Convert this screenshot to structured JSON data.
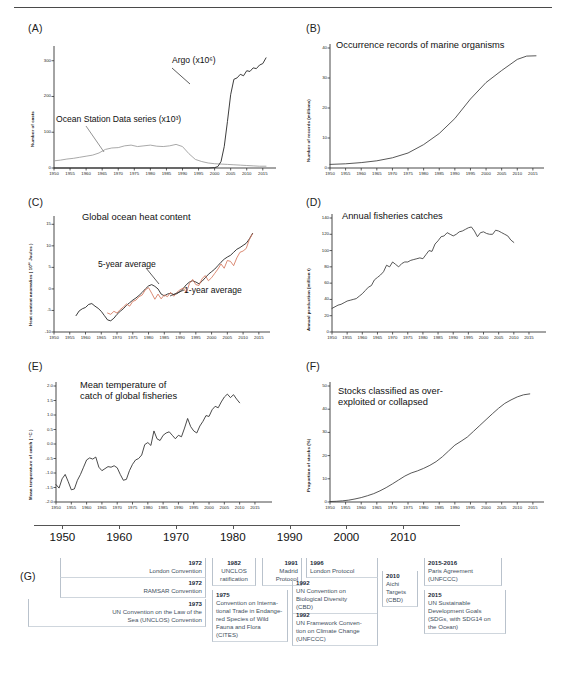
{
  "figure": {
    "panels": [
      "(A)",
      "(B)",
      "(C)",
      "(D)",
      "(E)",
      "(F)",
      "(G)"
    ]
  },
  "panelA": {
    "label": "(A)",
    "ylabel": "Number of casts",
    "annotation_ocean": "Ocean Station Data series (x10³)",
    "annotation_argo": "Argo (x10⁶)"
  },
  "panelB": {
    "label": "(B)",
    "title": "Occurrence records of marine organisms",
    "ylabel": "Number of records (millions)"
  },
  "panelC": {
    "label": "(C)",
    "title": "Global ocean heat content",
    "ylabel": "Heat content anomalies ( 10²² Joules )",
    "annotation_5yr": "5-year average",
    "annotation_1yr": "1-year average",
    "color_1yr": "#d4765c",
    "color_5yr": "#1a1a1a"
  },
  "panelD": {
    "label": "(D)",
    "title": "Annual fisheries catches",
    "ylabel": "Annual production (million t)"
  },
  "panelE": {
    "label": "(E)",
    "title": "Mean temperature of\ncatch of global fisheries",
    "ylabel": "Mean temperature of catch ( °C )"
  },
  "panelF": {
    "label": "(F)",
    "title": "Stocks classified as over-\nexploited or collapsed",
    "ylabel": "Proportion of stocks (%)"
  },
  "panelG": {
    "label": "(G)",
    "axis_years": [
      1950,
      1960,
      1970,
      1980,
      1990,
      2000,
      2010
    ],
    "events": [
      {
        "year": "1972",
        "text": "London Convention",
        "align": "right"
      },
      {
        "year": "1972",
        "text": "RAMSAR Convention",
        "align": "right"
      },
      {
        "year": "1973",
        "text": "UN Convention on the Law of the\nSea (UNCLOS) Convention",
        "align": "right"
      },
      {
        "year": "1982",
        "text": "UNCLOS\nratification",
        "align": "center"
      },
      {
        "year": "1975",
        "text": "Convention on Interna-\ntional Trade in Endange-\nred Species of Wild\nFauna and Flora (CITES)",
        "align": "left"
      },
      {
        "year": "1991",
        "text": "Madrid\nProtocol",
        "align": "right"
      },
      {
        "year": "1996",
        "text": "London Protocol",
        "align": "left"
      },
      {
        "year": "1992",
        "text": "UN Convention on\nBiological Diversity\n(CBD)",
        "align": "left"
      },
      {
        "year": "1992",
        "text": "UN Framework Conven-\ntion on Climate Change\n(UNFCCC)",
        "align": "left"
      },
      {
        "year": "2010",
        "text": "Aichi\nTargets\n(CBD)",
        "align": "left"
      },
      {
        "year": "2015-2016",
        "text": "Paris Agreement\n(UNFCCC)",
        "align": "left"
      },
      {
        "year": "2015",
        "text": "UN Sustainable\nDevelopment Goals\n(SDGs, with SDG14 on\nthe Ocean)",
        "align": "left"
      }
    ]
  },
  "chart_data": [
    {
      "id": "A",
      "type": "line",
      "title": "",
      "xlabel": "",
      "ylabel": "Number of casts",
      "xlim": [
        1950,
        2016
      ],
      "ylim": [
        0,
        330
      ],
      "yticks": [
        0,
        100,
        200,
        300
      ],
      "xticks": [
        1950,
        1955,
        1960,
        1965,
        1970,
        1975,
        1980,
        1985,
        1990,
        1995,
        2000,
        2005,
        2010,
        2015
      ],
      "grid": false,
      "legend": "inline-annotations",
      "series": [
        {
          "name": "Ocean Station Data series (x10^3)",
          "color": "#9a9a9a",
          "x": [
            1950,
            1952,
            1954,
            1956,
            1958,
            1960,
            1962,
            1964,
            1966,
            1968,
            1970,
            1972,
            1974,
            1976,
            1978,
            1980,
            1982,
            1984,
            1986,
            1988,
            1990,
            1992,
            1994,
            1996,
            1998,
            2000,
            2002,
            2004,
            2006,
            2008,
            2010,
            2012,
            2014,
            2016
          ],
          "y": [
            20,
            22,
            25,
            27,
            30,
            33,
            36,
            42,
            52,
            56,
            57,
            62,
            64,
            60,
            62,
            64,
            61,
            60,
            62,
            66,
            60,
            40,
            24,
            18,
            14,
            12,
            11,
            10,
            9,
            8,
            7,
            6,
            5,
            5
          ]
        },
        {
          "name": "Argo (x10^6)",
          "color": "#1a1a1a",
          "x": [
            1950,
            1990,
            1998,
            2000,
            2001,
            2002,
            2003,
            2004,
            2005,
            2006,
            2007,
            2008,
            2009,
            2010,
            2011,
            2012,
            2013,
            2014,
            2015,
            2016
          ],
          "y": [
            0,
            0,
            0,
            1,
            4,
            18,
            60,
            130,
            205,
            248,
            252,
            262,
            258,
            272,
            270,
            280,
            278,
            288,
            292,
            308
          ]
        }
      ]
    },
    {
      "id": "B",
      "type": "line",
      "title": "Occurrence records of marine organisms",
      "ylabel": "Number of records (millions)",
      "xlim": [
        1950,
        2016
      ],
      "ylim": [
        0,
        40
      ],
      "yticks": [
        0,
        10,
        20,
        30,
        40
      ],
      "xticks": [
        1950,
        1955,
        1960,
        1965,
        1970,
        1975,
        1980,
        1985,
        1990,
        1995,
        2000,
        2005,
        2010,
        2015
      ],
      "grid": false,
      "series": [
        {
          "name": "Cumulative occurrence records",
          "color": "#3a3a3a",
          "x": [
            1950,
            1955,
            1960,
            1965,
            1970,
            1975,
            1980,
            1985,
            1990,
            1995,
            2000,
            2005,
            2010,
            2013,
            2016
          ],
          "y": [
            1.2,
            1.4,
            1.8,
            2.4,
            3.4,
            5.0,
            7.8,
            11.5,
            16.5,
            23.0,
            28.5,
            32.5,
            36.2,
            37.3,
            37.4
          ]
        }
      ]
    },
    {
      "id": "C",
      "type": "line",
      "title": "Global ocean heat content",
      "ylabel": "Heat content anomalies (10^22 Joules)",
      "xlim": [
        1950,
        2016
      ],
      "ylim": [
        -10,
        16
      ],
      "yticks": [
        -10,
        -5,
        0,
        5,
        10,
        15
      ],
      "xticks": [
        1950,
        1955,
        1960,
        1965,
        1970,
        1975,
        1980,
        1985,
        1990,
        1995,
        2000,
        2005,
        2010,
        2015
      ],
      "grid": false,
      "series": [
        {
          "name": "5-year average",
          "color": "#1a1a1a",
          "x": [
            1957,
            1958,
            1959,
            1960,
            1961,
            1962,
            1963,
            1964,
            1965,
            1966,
            1967,
            1968,
            1969,
            1970,
            1971,
            1972,
            1973,
            1974,
            1975,
            1976,
            1977,
            1978,
            1979,
            1980,
            1981,
            1982,
            1983,
            1984,
            1985,
            1986,
            1987,
            1988,
            1989,
            1990,
            1991,
            1992,
            1993,
            1994,
            1995,
            1996,
            1997,
            1998,
            1999,
            2000,
            2001,
            2002,
            2003,
            2004,
            2005,
            2006,
            2007,
            2008,
            2009,
            2010,
            2011,
            2012,
            2013
          ],
          "y": [
            -6.2,
            -5.1,
            -4.6,
            -4.3,
            -3.6,
            -3.4,
            -4.0,
            -4.5,
            -5.2,
            -6.2,
            -7.2,
            -7.4,
            -6.8,
            -5.9,
            -5.2,
            -4.6,
            -3.8,
            -3.2,
            -2.6,
            -2.1,
            -1.5,
            -0.8,
            0.0,
            0.7,
            1.0,
            0.6,
            0.0,
            -1.2,
            -1.6,
            -1.2,
            -1.0,
            -1.3,
            -1.1,
            -0.6,
            0.1,
            1.0,
            1.6,
            1.9,
            1.6,
            1.2,
            1.8,
            2.6,
            3.4,
            4.0,
            4.6,
            5.4,
            6.2,
            6.9,
            7.4,
            7.8,
            8.5,
            9.2,
            9.6,
            10.1,
            10.6,
            11.6,
            12.9
          ]
        },
        {
          "name": "1-year average",
          "color": "#d4765c",
          "x": [
            1967,
            1968,
            1969,
            1970,
            1971,
            1972,
            1973,
            1974,
            1975,
            1976,
            1977,
            1978,
            1979,
            1980,
            1981,
            1982,
            1983,
            1984,
            1985,
            1986,
            1987,
            1988,
            1989,
            1990,
            1991,
            1992,
            1993,
            1994,
            1995,
            1996,
            1997,
            1998,
            1999,
            2000,
            2001,
            2002,
            2003,
            2004,
            2005,
            2006,
            2007,
            2008,
            2009,
            2010,
            2011,
            2012,
            2013
          ],
          "y": [
            -5.6,
            -5.9,
            -5.2,
            -5.6,
            -4.8,
            -4.2,
            -3.5,
            -4.0,
            -2.9,
            -2.6,
            -1.8,
            -1.4,
            -0.2,
            0.3,
            -1.0,
            -2.4,
            -1.2,
            -2.3,
            -1.4,
            -1.8,
            -0.8,
            -1.7,
            -0.8,
            -0.2,
            0.2,
            -0.9,
            1.3,
            2.2,
            1.0,
            0.8,
            2.4,
            3.1,
            1.9,
            2.6,
            3.6,
            4.6,
            5.8,
            4.8,
            6.6,
            6.4,
            5.4,
            7.2,
            8.5,
            8.8,
            9.4,
            11.5,
            12.8
          ]
        }
      ]
    },
    {
      "id": "D",
      "type": "line",
      "title": "Annual fisheries catches",
      "ylabel": "Annual production (million t)",
      "xlim": [
        1950,
        2016
      ],
      "ylim": [
        0,
        140
      ],
      "yticks": [
        0,
        20,
        40,
        60,
        80,
        100,
        120,
        140
      ],
      "xticks": [
        1950,
        1955,
        1960,
        1965,
        1970,
        1975,
        1980,
        1985,
        1990,
        1995,
        2000,
        2005,
        2010,
        2015
      ],
      "grid": false,
      "series": [
        {
          "name": "Annual production",
          "color": "#3a3a3a",
          "x": [
            1950,
            1951,
            1952,
            1953,
            1954,
            1955,
            1956,
            1957,
            1958,
            1959,
            1960,
            1961,
            1962,
            1963,
            1964,
            1965,
            1966,
            1967,
            1968,
            1969,
            1970,
            1971,
            1972,
            1973,
            1974,
            1975,
            1976,
            1977,
            1978,
            1979,
            1980,
            1981,
            1982,
            1983,
            1984,
            1985,
            1986,
            1987,
            1988,
            1989,
            1990,
            1991,
            1992,
            1993,
            1994,
            1995,
            1996,
            1997,
            1998,
            1999,
            2000,
            2001,
            2002,
            2003,
            2004,
            2005,
            2006,
            2007,
            2008,
            2009,
            2010
          ],
          "y": [
            29,
            31,
            33,
            34,
            36,
            38,
            39,
            40,
            41,
            44,
            47,
            51,
            55,
            57,
            64,
            67,
            70,
            74,
            82,
            80,
            86,
            83,
            80,
            84,
            86,
            86,
            88,
            89,
            90,
            91,
            90,
            95,
            100,
            99,
            108,
            112,
            117,
            118,
            122,
            120,
            118,
            120,
            123,
            124,
            126,
            128,
            129,
            124,
            117,
            122,
            123,
            121,
            120,
            120,
            125,
            124,
            122,
            120,
            118,
            113,
            110
          ]
        }
      ]
    },
    {
      "id": "E",
      "type": "line",
      "title": "Mean temperature of catch of global fisheries",
      "ylabel": "Mean temperature of catch (°C)",
      "xlim": [
        1950,
        2016
      ],
      "ylim": [
        -2.0,
        2.0
      ],
      "yticks": [
        -2.0,
        -1.5,
        -1.0,
        -0.5,
        0.0,
        0.5,
        1.0,
        1.5,
        2.0
      ],
      "xticks": [
        1950,
        1955,
        1960,
        1965,
        1970,
        1975,
        1980,
        1985,
        1990,
        1995,
        2000,
        2005,
        2010,
        2015
      ],
      "grid": false,
      "series": [
        {
          "name": "Mean temperature of catch anomaly",
          "color": "#2a2a2a",
          "x": [
            1950,
            1951,
            1952,
            1953,
            1954,
            1955,
            1956,
            1957,
            1958,
            1959,
            1960,
            1961,
            1962,
            1963,
            1964,
            1965,
            1966,
            1967,
            1968,
            1969,
            1970,
            1971,
            1972,
            1973,
            1974,
            1975,
            1976,
            1977,
            1978,
            1979,
            1980,
            1981,
            1982,
            1983,
            1984,
            1985,
            1986,
            1987,
            1988,
            1989,
            1990,
            1991,
            1992,
            1993,
            1994,
            1995,
            1996,
            1997,
            1998,
            1999,
            2000,
            2001,
            2002,
            2003,
            2004,
            2005,
            2006,
            2007,
            2008,
            2009,
            2010
          ],
          "y": [
            -1.4,
            -1.52,
            -1.2,
            -1.05,
            -1.3,
            -1.58,
            -1.55,
            -1.25,
            -1.05,
            -0.8,
            -0.55,
            -0.48,
            -0.52,
            -0.45,
            -0.8,
            -0.92,
            -0.85,
            -0.78,
            -0.8,
            -0.75,
            -0.82,
            -1.05,
            -1.25,
            -1.22,
            -0.92,
            -0.7,
            -0.55,
            -0.5,
            -0.38,
            -0.02,
            0.05,
            -0.05,
            0.45,
            0.18,
            0.12,
            0.3,
            0.38,
            0.42,
            0.3,
            0.18,
            0.3,
            0.25,
            0.55,
            0.88,
            0.6,
            0.45,
            0.38,
            0.62,
            0.78,
            0.98,
            0.95,
            1.18,
            1.3,
            1.25,
            1.45,
            1.62,
            1.72,
            1.6,
            1.7,
            1.55,
            1.42
          ]
        }
      ]
    },
    {
      "id": "F",
      "type": "line",
      "title": "Stocks classified as over-exploited or collapsed",
      "ylabel": "Proportion of stocks (%)",
      "xlim": [
        1950,
        2016
      ],
      "ylim": [
        0,
        50
      ],
      "yticks": [
        0,
        10,
        20,
        30,
        40,
        50
      ],
      "xticks": [
        1950,
        1955,
        1960,
        1965,
        1970,
        1975,
        1980,
        1985,
        1990,
        1995,
        2000,
        2005,
        2010,
        2015
      ],
      "grid": false,
      "series": [
        {
          "name": "Proportion over-exploited or collapsed",
          "color": "#3a3a3a",
          "x": [
            1950,
            1952,
            1954,
            1956,
            1958,
            1960,
            1962,
            1964,
            1966,
            1968,
            1970,
            1972,
            1974,
            1976,
            1978,
            1980,
            1982,
            1984,
            1986,
            1988,
            1990,
            1992,
            1994,
            1996,
            1998,
            2000,
            2002,
            2004,
            2006,
            2008,
            2010,
            2012,
            2014
          ],
          "y": [
            0.2,
            0.3,
            0.5,
            0.8,
            1.3,
            1.9,
            2.7,
            3.6,
            4.8,
            6.2,
            7.8,
            9.5,
            11.2,
            12.5,
            13.4,
            14.5,
            15.8,
            17.4,
            19.5,
            22.0,
            24.5,
            26.2,
            28.0,
            30.5,
            33.0,
            35.5,
            38.0,
            40.4,
            42.5,
            44.0,
            45.3,
            46.2,
            46.6
          ]
        }
      ]
    }
  ]
}
